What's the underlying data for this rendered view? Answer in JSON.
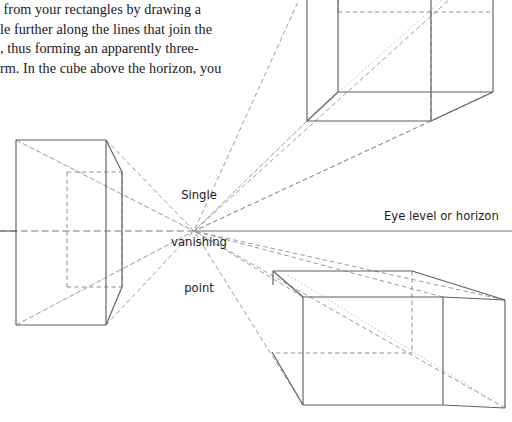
{
  "page": {
    "width": 512,
    "height": 422,
    "background": "#ffffff",
    "ink": "#17171a",
    "line_color": "#6f6f75",
    "dash_color": "#8a8a90",
    "dot_color": "#a8a8ae"
  },
  "body_text": {
    "lines": [
      " from your rectangles by drawing a",
      "le further along the lines that join the",
      ", thus forming an apparently three-",
      "rm. In the cube above the horizon, you"
    ]
  },
  "labels": {
    "vanishing_point": "Single\nvanishing\npoint",
    "vanishing_point_lines": [
      "Single",
      "vanishing",
      "point"
    ],
    "horizon": "Eye level or horizon"
  },
  "diagram": {
    "type": "one-point-perspective-construction",
    "vanishing_point": {
      "x": 194,
      "y": 231
    },
    "horizon_line": {
      "y": 231,
      "x_start": 0,
      "x_end": 512
    },
    "boxes": [
      {
        "name": "left-box-below-eye-level-left",
        "position": "left of vanishing point, straddling horizon",
        "near_face": {
          "left": 16,
          "top": 140,
          "right": 106,
          "bottom": 325
        },
        "far_face": {
          "left": 67,
          "top": 172,
          "right": 122,
          "bottom": 287
        }
      },
      {
        "name": "upper-right-box-above-horizon",
        "position": "above horizon, right of vanishing point",
        "near_face": {
          "left": 307,
          "top": -18,
          "right": 431,
          "bottom": 121
        },
        "far_face": {
          "left": 338,
          "top": 12,
          "right": 493,
          "bottom": 92
        }
      },
      {
        "name": "lower-right-box-below-horizon",
        "position": "below horizon, right of vanishing point",
        "near_face": {
          "left": 303,
          "top": 297,
          "right": 443,
          "bottom": 405
        },
        "far_face": {
          "left": 412,
          "top": 271,
          "right": 505,
          "bottom": 408
        }
      }
    ]
  }
}
